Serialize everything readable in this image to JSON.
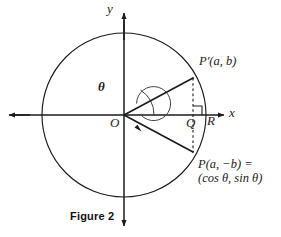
{
  "figure": {
    "caption": "Figure 2",
    "type": "unit-circle-trigonometry-diagram"
  },
  "axes": {
    "x_label": "x",
    "y_label": "y",
    "origin_label": "O"
  },
  "labels": {
    "angle": "θ",
    "point_q": "Q",
    "point_r": "R",
    "point_p_prime": "P′(a, b)",
    "point_p_line1": "P(a, −b) =",
    "point_p_line2": "(cos θ, sin θ)"
  },
  "geometry": {
    "center_x": 124,
    "center_y": 115,
    "radius": 82,
    "inner_arc_radius": 17,
    "small_angle_arc_radius": 30,
    "p_prime_x": 193,
    "p_prime_y": 78,
    "p_x": 193,
    "p_y": 152,
    "q_x": 193,
    "q_y": 115,
    "r_x": 206,
    "r_y": 115
  },
  "colors": {
    "stroke": "#1a1a1a",
    "background": "#ffffff",
    "thin_stroke": "#2a2a2a"
  }
}
